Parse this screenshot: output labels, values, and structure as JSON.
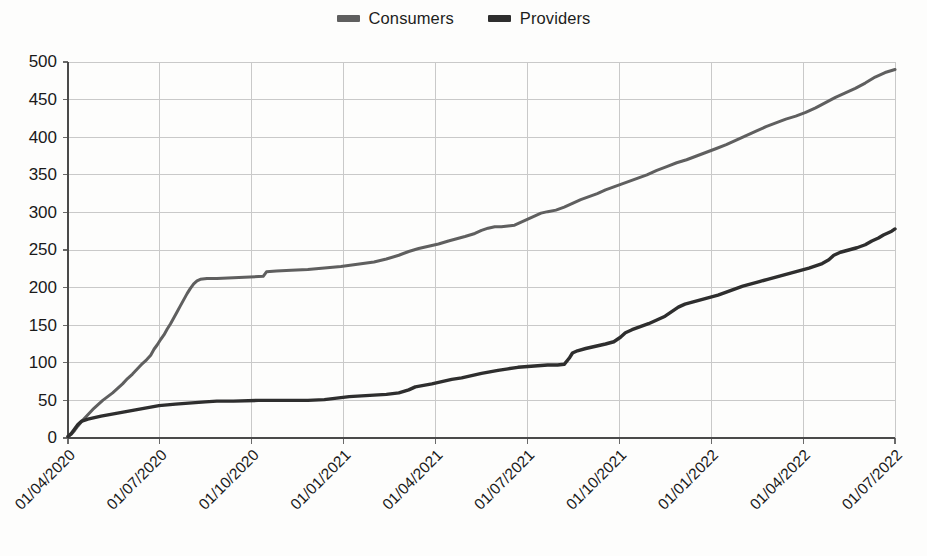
{
  "legend": {
    "position": "top-center",
    "items": [
      {
        "label": "Consumers",
        "color": "#5f5f5f"
      },
      {
        "label": "Providers",
        "color": "#2e2e2e"
      }
    ]
  },
  "axes": {
    "y_ticks": [
      "0",
      "50",
      "100",
      "150",
      "200",
      "250",
      "300",
      "350",
      "400",
      "450",
      "500"
    ],
    "x_ticks": [
      "01/04/2020",
      "01/07/2020",
      "01/10/2020",
      "01/01/2021",
      "01/04/2021",
      "01/07/2021",
      "01/10/2021",
      "01/01/2022",
      "01/04/2022",
      "01/07/2022"
    ],
    "y_min": 0,
    "y_max": 500,
    "y_step": 50
  },
  "style": {
    "background": "#fdfdfc",
    "grid_color": "#c9c9c9",
    "axis_color": "#4a4a4a"
  },
  "chart_data": {
    "type": "line",
    "title": "",
    "subtitle": "",
    "xlabel": "",
    "ylabel": "",
    "ylim": [
      0,
      500
    ],
    "grid": true,
    "legend_position": "top-center",
    "x_tick_labels": [
      "01/04/2020",
      "01/07/2020",
      "01/10/2020",
      "01/01/2021",
      "01/04/2021",
      "01/07/2021",
      "01/10/2021",
      "01/01/2022",
      "01/04/2022",
      "01/07/2022"
    ],
    "x_axis_type": "date",
    "x_range": [
      "01/04/2020",
      "01/07/2022"
    ],
    "series": [
      {
        "name": "Consumers",
        "color": "#5f5f5f",
        "points": [
          [
            0.0,
            2
          ],
          [
            0.004,
            5
          ],
          [
            0.008,
            10
          ],
          [
            0.012,
            16
          ],
          [
            0.018,
            24
          ],
          [
            0.024,
            31
          ],
          [
            0.03,
            38
          ],
          [
            0.036,
            44
          ],
          [
            0.042,
            50
          ],
          [
            0.048,
            55
          ],
          [
            0.054,
            60
          ],
          [
            0.06,
            66
          ],
          [
            0.066,
            72
          ],
          [
            0.072,
            79
          ],
          [
            0.078,
            85
          ],
          [
            0.084,
            92
          ],
          [
            0.09,
            99
          ],
          [
            0.095,
            104
          ],
          [
            0.1,
            110
          ],
          [
            0.104,
            118
          ],
          [
            0.108,
            124
          ],
          [
            0.112,
            131
          ],
          [
            0.116,
            137
          ],
          [
            0.12,
            145
          ],
          [
            0.124,
            152
          ],
          [
            0.128,
            160
          ],
          [
            0.132,
            168
          ],
          [
            0.136,
            176
          ],
          [
            0.14,
            184
          ],
          [
            0.144,
            192
          ],
          [
            0.148,
            199
          ],
          [
            0.152,
            205
          ],
          [
            0.156,
            209
          ],
          [
            0.16,
            211
          ],
          [
            0.168,
            212
          ],
          [
            0.18,
            212
          ],
          [
            0.2,
            213
          ],
          [
            0.22,
            214
          ],
          [
            0.236,
            215
          ],
          [
            0.24,
            221
          ],
          [
            0.252,
            222
          ],
          [
            0.27,
            223
          ],
          [
            0.29,
            224
          ],
          [
            0.31,
            226
          ],
          [
            0.33,
            228
          ],
          [
            0.35,
            231
          ],
          [
            0.37,
            234
          ],
          [
            0.385,
            238
          ],
          [
            0.4,
            243
          ],
          [
            0.412,
            248
          ],
          [
            0.424,
            252
          ],
          [
            0.436,
            255
          ],
          [
            0.448,
            258
          ],
          [
            0.46,
            262
          ],
          [
            0.47,
            265
          ],
          [
            0.48,
            268
          ],
          [
            0.492,
            272
          ],
          [
            0.5,
            276
          ],
          [
            0.508,
            279
          ],
          [
            0.516,
            281
          ],
          [
            0.524,
            281
          ],
          [
            0.532,
            282
          ],
          [
            0.54,
            283
          ],
          [
            0.548,
            287
          ],
          [
            0.556,
            291
          ],
          [
            0.564,
            295
          ],
          [
            0.572,
            299
          ],
          [
            0.58,
            301
          ],
          [
            0.59,
            303
          ],
          [
            0.6,
            307
          ],
          [
            0.61,
            312
          ],
          [
            0.62,
            317
          ],
          [
            0.63,
            321
          ],
          [
            0.64,
            325
          ],
          [
            0.65,
            330
          ],
          [
            0.66,
            334
          ],
          [
            0.67,
            338
          ],
          [
            0.68,
            342
          ],
          [
            0.69,
            346
          ],
          [
            0.7,
            350
          ],
          [
            0.712,
            356
          ],
          [
            0.724,
            361
          ],
          [
            0.736,
            366
          ],
          [
            0.748,
            370
          ],
          [
            0.76,
            375
          ],
          [
            0.772,
            380
          ],
          [
            0.784,
            385
          ],
          [
            0.796,
            390
          ],
          [
            0.808,
            396
          ],
          [
            0.82,
            402
          ],
          [
            0.832,
            408
          ],
          [
            0.844,
            414
          ],
          [
            0.856,
            419
          ],
          [
            0.868,
            424
          ],
          [
            0.88,
            428
          ],
          [
            0.892,
            433
          ],
          [
            0.904,
            439
          ],
          [
            0.916,
            446
          ],
          [
            0.928,
            453
          ],
          [
            0.94,
            459
          ],
          [
            0.952,
            465
          ],
          [
            0.964,
            472
          ],
          [
            0.976,
            480
          ],
          [
            0.988,
            486
          ],
          [
            1.0,
            490
          ]
        ],
        "start_value": 2,
        "end_value": 490
      },
      {
        "name": "Providers",
        "color": "#2e2e2e",
        "points": [
          [
            0.0,
            2
          ],
          [
            0.004,
            6
          ],
          [
            0.008,
            12
          ],
          [
            0.012,
            18
          ],
          [
            0.016,
            22
          ],
          [
            0.024,
            25
          ],
          [
            0.032,
            27
          ],
          [
            0.04,
            29
          ],
          [
            0.05,
            31
          ],
          [
            0.06,
            33
          ],
          [
            0.07,
            35
          ],
          [
            0.08,
            37
          ],
          [
            0.09,
            39
          ],
          [
            0.1,
            41
          ],
          [
            0.11,
            43
          ],
          [
            0.12,
            44
          ],
          [
            0.13,
            45
          ],
          [
            0.142,
            46
          ],
          [
            0.154,
            47
          ],
          [
            0.166,
            48
          ],
          [
            0.18,
            49
          ],
          [
            0.2,
            49
          ],
          [
            0.23,
            50
          ],
          [
            0.26,
            50
          ],
          [
            0.29,
            50
          ],
          [
            0.31,
            51
          ],
          [
            0.325,
            53
          ],
          [
            0.34,
            55
          ],
          [
            0.355,
            56
          ],
          [
            0.37,
            57
          ],
          [
            0.385,
            58
          ],
          [
            0.4,
            60
          ],
          [
            0.412,
            64
          ],
          [
            0.42,
            68
          ],
          [
            0.43,
            70
          ],
          [
            0.44,
            72
          ],
          [
            0.452,
            75
          ],
          [
            0.464,
            78
          ],
          [
            0.476,
            80
          ],
          [
            0.488,
            83
          ],
          [
            0.5,
            86
          ],
          [
            0.51,
            88
          ],
          [
            0.52,
            90
          ],
          [
            0.532,
            92
          ],
          [
            0.544,
            94
          ],
          [
            0.556,
            95
          ],
          [
            0.568,
            96
          ],
          [
            0.58,
            97
          ],
          [
            0.592,
            97
          ],
          [
            0.6,
            98
          ],
          [
            0.606,
            106
          ],
          [
            0.61,
            113
          ],
          [
            0.616,
            116
          ],
          [
            0.626,
            119
          ],
          [
            0.638,
            122
          ],
          [
            0.65,
            125
          ],
          [
            0.66,
            128
          ],
          [
            0.668,
            134
          ],
          [
            0.674,
            140
          ],
          [
            0.682,
            144
          ],
          [
            0.692,
            148
          ],
          [
            0.702,
            152
          ],
          [
            0.712,
            157
          ],
          [
            0.722,
            162
          ],
          [
            0.73,
            168
          ],
          [
            0.738,
            174
          ],
          [
            0.746,
            178
          ],
          [
            0.756,
            181
          ],
          [
            0.766,
            184
          ],
          [
            0.776,
            187
          ],
          [
            0.786,
            190
          ],
          [
            0.796,
            194
          ],
          [
            0.806,
            198
          ],
          [
            0.816,
            202
          ],
          [
            0.826,
            205
          ],
          [
            0.836,
            208
          ],
          [
            0.846,
            211
          ],
          [
            0.856,
            214
          ],
          [
            0.866,
            217
          ],
          [
            0.876,
            220
          ],
          [
            0.886,
            223
          ],
          [
            0.896,
            226
          ],
          [
            0.904,
            229
          ],
          [
            0.912,
            232
          ],
          [
            0.92,
            237
          ],
          [
            0.926,
            243
          ],
          [
            0.934,
            247
          ],
          [
            0.944,
            250
          ],
          [
            0.954,
            253
          ],
          [
            0.964,
            257
          ],
          [
            0.972,
            262
          ],
          [
            0.98,
            266
          ],
          [
            0.986,
            270
          ],
          [
            0.992,
            273
          ],
          [
            0.996,
            275
          ],
          [
            1.0,
            278
          ]
        ],
        "start_value": 2,
        "end_value": 278
      }
    ]
  }
}
